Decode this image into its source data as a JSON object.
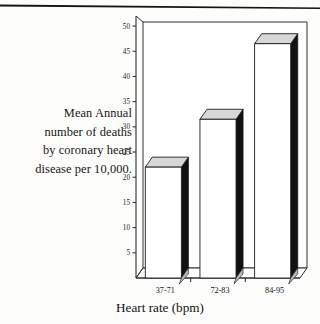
{
  "figure": {
    "caption_lines": [
      "Mean Annual",
      "number of deaths",
      "by coronary heart",
      "disease per 10,000."
    ],
    "scan_rule_name": "page-edge-rule"
  },
  "chart_data": {
    "type": "bar",
    "title": "",
    "subtitle": "",
    "xlabel": "Heart rate (bpm)",
    "ylabel": "Mean Annual number of deaths by coronary heart disease per 10,000.",
    "categories": [
      "37-71",
      "72-83",
      "84-95"
    ],
    "values": [
      22,
      31.5,
      46.5
    ],
    "series": [
      {
        "name": "Mean annual deaths per 10,000",
        "values": [
          22,
          31.5,
          46.5
        ]
      }
    ],
    "ylim": [
      0,
      52
    ],
    "ytick_labels": [
      "5",
      "10",
      "15",
      "20",
      "25",
      "30",
      "35",
      "40",
      "45",
      "50"
    ],
    "ytick_values": [
      5,
      10,
      15,
      20,
      25,
      30,
      35,
      40,
      45,
      50
    ],
    "grid": false,
    "legend": false,
    "legend_position": "none",
    "style": "3d-bar",
    "colors": {
      "bar_front": "#ffffff",
      "bar_top": "#d7d7d7",
      "bar_side": "#111111",
      "axis": "#2a2a2a",
      "wall": "#ffffff",
      "text": "#141414"
    }
  }
}
